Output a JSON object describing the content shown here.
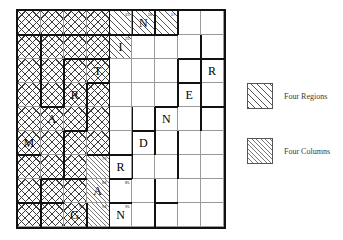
{
  "figure": {
    "type": "grid-puzzle-diagram",
    "rows": 9,
    "cols": 9
  },
  "legend": {
    "items": [
      {
        "label": "Four Regions",
        "pattern": "diagonal-hatch-coarse",
        "color": "#555555"
      },
      {
        "label": "Four Columns",
        "pattern": "diagonal-hatch-fine",
        "color": "#777777"
      }
    ]
  },
  "grid": {
    "cells": [
      {
        "r": 0,
        "c": 0,
        "fill": "cross",
        "letter": "",
        "sup": ""
      },
      {
        "r": 0,
        "c": 1,
        "fill": "cross",
        "letter": "",
        "sup": ""
      },
      {
        "r": 0,
        "c": 2,
        "fill": "cross",
        "letter": "",
        "sup": ""
      },
      {
        "r": 0,
        "c": 3,
        "fill": "cross",
        "letter": "",
        "sup": ""
      },
      {
        "r": 0,
        "c": 4,
        "fill": "diagA",
        "letter": "",
        "sup": "15"
      },
      {
        "r": 0,
        "c": 5,
        "fill": "diagA",
        "letter": "N",
        "sup": "16"
      },
      {
        "r": 0,
        "c": 6,
        "fill": "diagA",
        "letter": "",
        "sup": "17"
      },
      {
        "r": 0,
        "c": 7,
        "fill": "plain",
        "letter": "",
        "sup": ""
      },
      {
        "r": 0,
        "c": 8,
        "fill": "plain",
        "letter": "",
        "sup": ""
      },
      {
        "r": 1,
        "c": 0,
        "fill": "cross",
        "letter": "",
        "sup": ""
      },
      {
        "r": 1,
        "c": 1,
        "fill": "cross",
        "letter": "",
        "sup": ""
      },
      {
        "r": 1,
        "c": 2,
        "fill": "cross",
        "letter": "",
        "sup": ""
      },
      {
        "r": 1,
        "c": 3,
        "fill": "cross",
        "letter": "",
        "sup": ""
      },
      {
        "r": 1,
        "c": 4,
        "fill": "diagA",
        "letter": "I",
        "sup": "25"
      },
      {
        "r": 1,
        "c": 5,
        "fill": "plain",
        "letter": "",
        "sup": ""
      },
      {
        "r": 1,
        "c": 6,
        "fill": "plain",
        "letter": "",
        "sup": ""
      },
      {
        "r": 1,
        "c": 7,
        "fill": "plain",
        "letter": "",
        "sup": ""
      },
      {
        "r": 1,
        "c": 8,
        "fill": "plain",
        "letter": "",
        "sup": ""
      },
      {
        "r": 2,
        "c": 0,
        "fill": "cross",
        "letter": "",
        "sup": ""
      },
      {
        "r": 2,
        "c": 1,
        "fill": "cross",
        "letter": "",
        "sup": ""
      },
      {
        "r": 2,
        "c": 2,
        "fill": "cross",
        "letter": "",
        "sup": ""
      },
      {
        "r": 2,
        "c": 3,
        "fill": "cross",
        "letter": "T",
        "sup": ""
      },
      {
        "r": 2,
        "c": 4,
        "fill": "plain",
        "letter": "",
        "sup": ""
      },
      {
        "r": 2,
        "c": 5,
        "fill": "plain",
        "letter": "",
        "sup": ""
      },
      {
        "r": 2,
        "c": 6,
        "fill": "plain",
        "letter": "",
        "sup": ""
      },
      {
        "r": 2,
        "c": 7,
        "fill": "plain",
        "letter": "",
        "sup": ""
      },
      {
        "r": 2,
        "c": 8,
        "fill": "plain",
        "letter": "R",
        "sup": ""
      },
      {
        "r": 3,
        "c": 0,
        "fill": "cross",
        "letter": "",
        "sup": ""
      },
      {
        "r": 3,
        "c": 1,
        "fill": "cross",
        "letter": "",
        "sup": ""
      },
      {
        "r": 3,
        "c": 2,
        "fill": "cross",
        "letter": "R",
        "sup": ""
      },
      {
        "r": 3,
        "c": 3,
        "fill": "cross",
        "letter": "",
        "sup": ""
      },
      {
        "r": 3,
        "c": 4,
        "fill": "plain",
        "letter": "",
        "sup": ""
      },
      {
        "r": 3,
        "c": 5,
        "fill": "plain",
        "letter": "",
        "sup": ""
      },
      {
        "r": 3,
        "c": 6,
        "fill": "plain",
        "letter": "",
        "sup": ""
      },
      {
        "r": 3,
        "c": 7,
        "fill": "plain",
        "letter": "E",
        "sup": ""
      },
      {
        "r": 3,
        "c": 8,
        "fill": "plain",
        "letter": "",
        "sup": ""
      },
      {
        "r": 4,
        "c": 0,
        "fill": "cross",
        "letter": "",
        "sup": ""
      },
      {
        "r": 4,
        "c": 1,
        "fill": "cross",
        "letter": "A",
        "sup": ""
      },
      {
        "r": 4,
        "c": 2,
        "fill": "cross",
        "letter": "",
        "sup": ""
      },
      {
        "r": 4,
        "c": 3,
        "fill": "cross",
        "letter": "",
        "sup": ""
      },
      {
        "r": 4,
        "c": 4,
        "fill": "plain",
        "letter": "",
        "sup": ""
      },
      {
        "r": 4,
        "c": 5,
        "fill": "plain",
        "letter": "",
        "sup": ""
      },
      {
        "r": 4,
        "c": 6,
        "fill": "plain",
        "letter": "N",
        "sup": ""
      },
      {
        "r": 4,
        "c": 7,
        "fill": "plain",
        "letter": "",
        "sup": ""
      },
      {
        "r": 4,
        "c": 8,
        "fill": "plain",
        "letter": "",
        "sup": ""
      },
      {
        "r": 5,
        "c": 0,
        "fill": "cross",
        "letter": "M",
        "sup": ""
      },
      {
        "r": 5,
        "c": 1,
        "fill": "cross",
        "letter": "",
        "sup": ""
      },
      {
        "r": 5,
        "c": 2,
        "fill": "cross",
        "letter": "",
        "sup": ""
      },
      {
        "r": 5,
        "c": 3,
        "fill": "cross",
        "letter": "",
        "sup": ""
      },
      {
        "r": 5,
        "c": 4,
        "fill": "plain",
        "letter": "",
        "sup": ""
      },
      {
        "r": 5,
        "c": 5,
        "fill": "plain",
        "letter": "D",
        "sup": ""
      },
      {
        "r": 5,
        "c": 6,
        "fill": "plain",
        "letter": "",
        "sup": ""
      },
      {
        "r": 5,
        "c": 7,
        "fill": "plain",
        "letter": "",
        "sup": ""
      },
      {
        "r": 5,
        "c": 8,
        "fill": "plain",
        "letter": "",
        "sup": ""
      },
      {
        "r": 6,
        "c": 0,
        "fill": "cross",
        "letter": "",
        "sup": ""
      },
      {
        "r": 6,
        "c": 1,
        "fill": "cross",
        "letter": "",
        "sup": ""
      },
      {
        "r": 6,
        "c": 2,
        "fill": "cross",
        "letter": "",
        "sup": ""
      },
      {
        "r": 6,
        "c": 3,
        "fill": "diagB",
        "letter": "",
        "sup": "73"
      },
      {
        "r": 6,
        "c": 4,
        "fill": "plain",
        "letter": "R",
        "sup": ""
      },
      {
        "r": 6,
        "c": 5,
        "fill": "plain",
        "letter": "",
        "sup": ""
      },
      {
        "r": 6,
        "c": 6,
        "fill": "plain",
        "letter": "",
        "sup": ""
      },
      {
        "r": 6,
        "c": 7,
        "fill": "plain",
        "letter": "",
        "sup": ""
      },
      {
        "r": 6,
        "c": 8,
        "fill": "plain",
        "letter": "",
        "sup": ""
      },
      {
        "r": 7,
        "c": 0,
        "fill": "cross",
        "letter": "",
        "sup": ""
      },
      {
        "r": 7,
        "c": 1,
        "fill": "cross",
        "letter": "",
        "sup": ""
      },
      {
        "r": 7,
        "c": 2,
        "fill": "cross",
        "letter": "",
        "sup": ""
      },
      {
        "r": 7,
        "c": 3,
        "fill": "diagB",
        "letter": "A",
        "sup": "84"
      },
      {
        "r": 7,
        "c": 4,
        "fill": "plain",
        "letter": "",
        "sup": "85"
      },
      {
        "r": 7,
        "c": 5,
        "fill": "plain",
        "letter": "",
        "sup": ""
      },
      {
        "r": 7,
        "c": 6,
        "fill": "plain",
        "letter": "",
        "sup": ""
      },
      {
        "r": 7,
        "c": 7,
        "fill": "plain",
        "letter": "",
        "sup": ""
      },
      {
        "r": 7,
        "c": 8,
        "fill": "plain",
        "letter": "",
        "sup": ""
      },
      {
        "r": 8,
        "c": 0,
        "fill": "cross",
        "letter": "",
        "sup": ""
      },
      {
        "r": 8,
        "c": 1,
        "fill": "cross",
        "letter": "",
        "sup": ""
      },
      {
        "r": 8,
        "c": 2,
        "fill": "cross",
        "letter": "G",
        "sup": "93"
      },
      {
        "r": 8,
        "c": 3,
        "fill": "diagB",
        "letter": "",
        "sup": "94"
      },
      {
        "r": 8,
        "c": 4,
        "fill": "plain",
        "letter": "N",
        "sup": "95"
      },
      {
        "r": 8,
        "c": 5,
        "fill": "plain",
        "letter": "",
        "sup": ""
      },
      {
        "r": 8,
        "c": 6,
        "fill": "plain",
        "letter": "",
        "sup": ""
      },
      {
        "r": 8,
        "c": 7,
        "fill": "plain",
        "letter": "",
        "sup": ""
      },
      {
        "r": 8,
        "c": 8,
        "fill": "plain",
        "letter": "",
        "sup": ""
      }
    ],
    "heavy_edges_h": [
      {
        "r": 1,
        "c0": 0,
        "c1": 4
      },
      {
        "r": 1,
        "c0": 4,
        "c1": 7
      },
      {
        "r": 2,
        "c0": 2,
        "c1": 4
      },
      {
        "r": 2,
        "c0": 7,
        "c1": 9
      },
      {
        "r": 3,
        "c0": 3,
        "c1": 4
      },
      {
        "r": 3,
        "c0": 7,
        "c1": 8
      },
      {
        "r": 4,
        "c0": 1,
        "c1": 2
      },
      {
        "r": 4,
        "c0": 6,
        "c1": 7
      },
      {
        "r": 4,
        "c0": 8,
        "c1": 9
      },
      {
        "r": 5,
        "c0": 2,
        "c1": 3
      },
      {
        "r": 5,
        "c0": 5,
        "c1": 6
      },
      {
        "r": 6,
        "c0": 0,
        "c1": 1
      },
      {
        "r": 6,
        "c0": 3,
        "c1": 5
      },
      {
        "r": 7,
        "c0": 1,
        "c1": 3
      },
      {
        "r": 7,
        "c0": 4,
        "c1": 5
      },
      {
        "r": 8,
        "c0": 0,
        "c1": 2
      },
      {
        "r": 8,
        "c0": 4,
        "c1": 5
      },
      {
        "r": 8,
        "c0": 6,
        "c1": 7
      }
    ],
    "heavy_edges_v": [
      {
        "c": 1,
        "r0": 1,
        "r1": 4
      },
      {
        "c": 1,
        "r0": 7,
        "r1": 9
      },
      {
        "c": 2,
        "r0": 2,
        "r1": 4
      },
      {
        "c": 2,
        "r0": 5,
        "r1": 7
      },
      {
        "c": 3,
        "r0": 3,
        "r1": 5
      },
      {
        "c": 3,
        "r0": 8,
        "r1": 9
      },
      {
        "c": 4,
        "r0": 0,
        "r1": 9
      },
      {
        "c": 5,
        "r0": 0,
        "r1": 1
      },
      {
        "c": 5,
        "r0": 4,
        "r1": 6
      },
      {
        "c": 5,
        "r0": 6,
        "r1": 7
      },
      {
        "c": 6,
        "r0": 0,
        "r1": 1
      },
      {
        "c": 6,
        "r0": 4,
        "r1": 6
      },
      {
        "c": 6,
        "r0": 7,
        "r1": 9
      },
      {
        "c": 7,
        "r0": 0,
        "r1": 1
      },
      {
        "c": 7,
        "r0": 2,
        "r1": 4
      },
      {
        "c": 7,
        "r0": 5,
        "r1": 7
      },
      {
        "c": 8,
        "r0": 1,
        "r1": 3
      },
      {
        "c": 8,
        "r0": 3,
        "r1": 5
      }
    ]
  }
}
